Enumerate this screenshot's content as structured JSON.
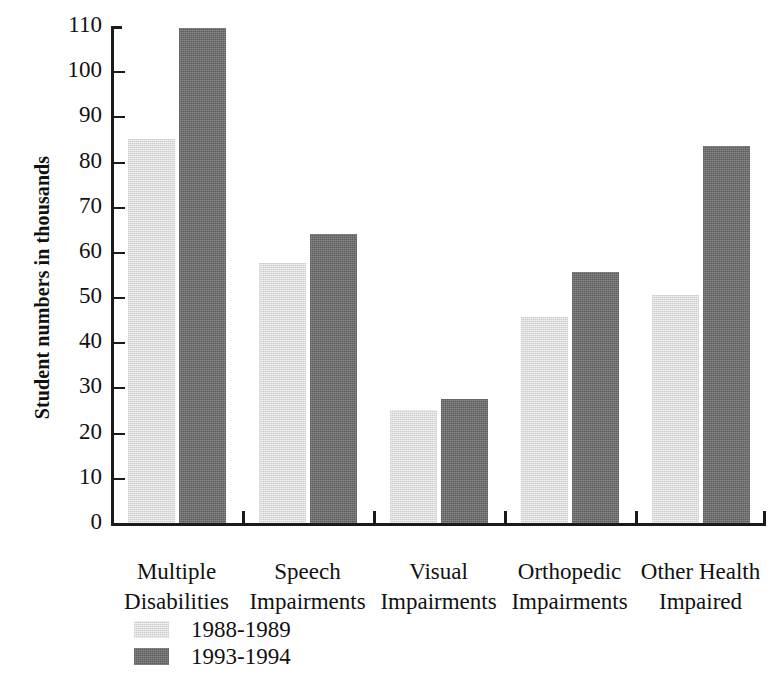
{
  "chart_data": {
    "type": "bar",
    "title": "",
    "xlabel": "",
    "ylabel": "Student numbers in thousands",
    "ylim": [
      0,
      110
    ],
    "ytick_step": 10,
    "grid": false,
    "legend_position": "bottom-left",
    "categories": [
      "Multiple Disabilities",
      "Speech Impairments",
      "Visual Impairments",
      "Orthopedic Impairments",
      "Other Health Impaired"
    ],
    "category_lines": [
      [
        "Multiple",
        "Disabilities"
      ],
      [
        "Speech",
        "Impairments"
      ],
      [
        "Visual",
        "Impairments"
      ],
      [
        "Orthopedic",
        "Impairments"
      ],
      [
        "Other Health",
        "Impaired"
      ]
    ],
    "ytick_labels": [
      "110",
      "100",
      "90",
      "80",
      "70",
      "60",
      "50",
      "40",
      "30",
      "20",
      "10",
      "0"
    ],
    "ytick_values": [
      110,
      100,
      90,
      80,
      70,
      60,
      50,
      40,
      30,
      20,
      10,
      0
    ],
    "series": [
      {
        "name": "1988-1989",
        "color": "#dedede",
        "values": [
          85,
          57.5,
          25,
          45.5,
          50.5
        ]
      },
      {
        "name": "1993-1994",
        "color": "#6f6f6f",
        "values": [
          109.5,
          64,
          27.5,
          55.5,
          83.5
        ]
      }
    ]
  },
  "legend": {
    "items": [
      {
        "label": "1988-1989",
        "swatch": "light"
      },
      {
        "label": "1993-1994",
        "swatch": "dark"
      }
    ]
  }
}
